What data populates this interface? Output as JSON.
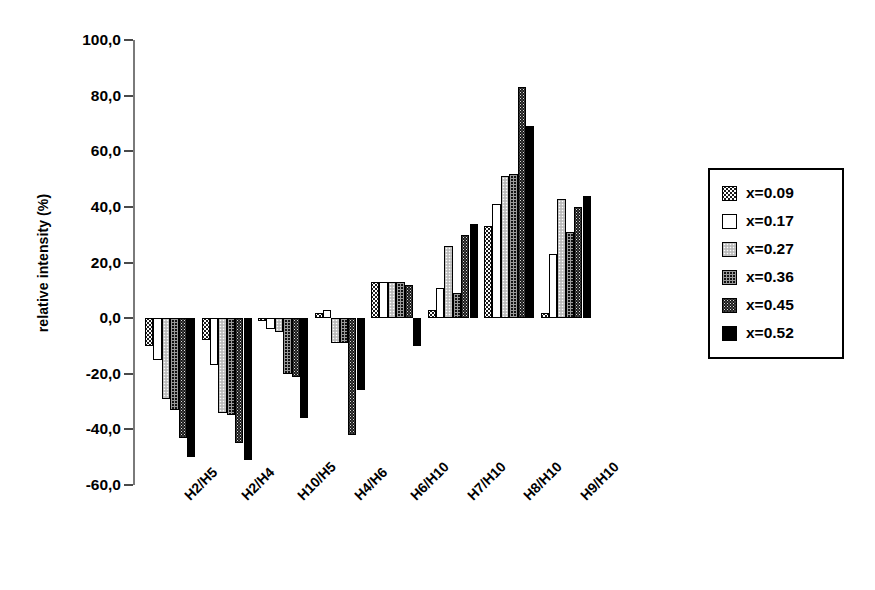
{
  "chart_data": {
    "type": "bar",
    "title": "",
    "xlabel": "",
    "ylabel": "relative intensity (%)",
    "ylim": [
      -60,
      100
    ],
    "ytick_step": 20,
    "ytick_labels": [
      "100,0",
      "80,0",
      "60,0",
      "40,0",
      "20,0",
      "0,0",
      "-20,0",
      "-40,0",
      "-60,0"
    ],
    "ytick_values": [
      100,
      80,
      60,
      40,
      20,
      0,
      -20,
      -40,
      -60
    ],
    "grid": false,
    "legend_position": "right",
    "categories": [
      "H2/H5",
      "H2/H4",
      "H10/H5",
      "H4/H6",
      "H6/H10",
      "H7/H10",
      "H8/H10",
      "H9/H10"
    ],
    "series": [
      {
        "name": "x=0.09",
        "fill": "checkered-dark",
        "values": [
          -10,
          -8,
          -1,
          2,
          13,
          3,
          33,
          2
        ]
      },
      {
        "name": "x=0.17",
        "fill": "white",
        "values": [
          -15,
          -17,
          -4,
          3,
          13,
          11,
          41,
          23
        ]
      },
      {
        "name": "x=0.27",
        "fill": "dotted-light",
        "values": [
          -29,
          -34,
          -5,
          -9,
          13,
          26,
          51,
          43
        ]
      },
      {
        "name": "x=0.36",
        "fill": "grid-dark",
        "values": [
          -33,
          -35,
          -20,
          -9,
          13,
          9,
          52,
          31
        ]
      },
      {
        "name": "x=0.45",
        "fill": "speckled-dark",
        "values": [
          -43,
          -45,
          -21,
          -42,
          12,
          30,
          83,
          40
        ]
      },
      {
        "name": "x=0.52",
        "fill": "solid-black",
        "values": [
          -50,
          -51,
          -36,
          -26,
          -10,
          34,
          69,
          44
        ]
      }
    ]
  },
  "legend": {
    "items": [
      {
        "label": "x=0.09"
      },
      {
        "label": "x=0.17"
      },
      {
        "label": "x=0.27"
      },
      {
        "label": "x=0.36"
      },
      {
        "label": "x=0.45"
      },
      {
        "label": "x=0.52"
      }
    ]
  },
  "colors": {
    "axis": "#7a7a7a",
    "tick": "#4a4a4a",
    "text": "#000000",
    "background": "#ffffff"
  }
}
